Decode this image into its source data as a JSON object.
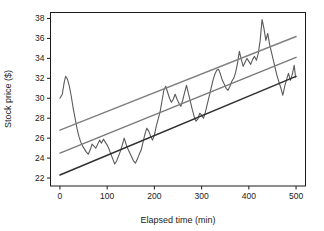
{
  "chart_data": {
    "type": "line",
    "title": "",
    "xlabel": "Elapsed time (min)",
    "ylabel": "Stock price ($)",
    "xlim": [
      -20,
      520
    ],
    "ylim": [
      21.2,
      38.6
    ],
    "xticks": [
      0,
      100,
      200,
      300,
      400,
      500
    ],
    "yticks": [
      22,
      24,
      26,
      28,
      30,
      32,
      34,
      36,
      38
    ],
    "grid": false,
    "legend": "none",
    "colors": {
      "price_series": "#5a5a5a",
      "upper_band": "#808080",
      "middle_trend": "#7a7a7a",
      "lower_band": "#2f2f2f",
      "axis": "#1a1a1a",
      "background": "#ffffff"
    },
    "series": [
      {
        "name": "Stock price",
        "kind": "noisy-line",
        "color": "#5a5a5a",
        "x": [
          0,
          5,
          9,
          12,
          16,
          20,
          24,
          28,
          32,
          36,
          40,
          44,
          48,
          52,
          56,
          60,
          64,
          68,
          72,
          76,
          80,
          84,
          88,
          92,
          96,
          100,
          104,
          108,
          112,
          116,
          120,
          124,
          128,
          132,
          136,
          140,
          144,
          148,
          152,
          156,
          160,
          164,
          168,
          172,
          176,
          180,
          184,
          188,
          192,
          196,
          200,
          204,
          208,
          212,
          216,
          220,
          224,
          228,
          232,
          236,
          240,
          244,
          248,
          252,
          256,
          260,
          264,
          268,
          272,
          276,
          280,
          284,
          288,
          292,
          296,
          300,
          304,
          308,
          312,
          316,
          320,
          324,
          328,
          332,
          336,
          340,
          344,
          348,
          352,
          356,
          360,
          364,
          368,
          372,
          376,
          380,
          384,
          388,
          392,
          396,
          400,
          404,
          408,
          412,
          416,
          420,
          424,
          428,
          432,
          436,
          440,
          444,
          448,
          452,
          456,
          460,
          464,
          468,
          472,
          476,
          480,
          484,
          488,
          492,
          496,
          499
        ],
        "y": [
          30.0,
          30.4,
          31.6,
          32.2,
          31.9,
          31.2,
          30.2,
          29.0,
          28.0,
          27.0,
          26.2,
          25.6,
          25.2,
          24.9,
          24.6,
          24.4,
          24.8,
          25.4,
          25.2,
          25.0,
          25.4,
          25.8,
          25.5,
          25.9,
          25.6,
          25.3,
          24.9,
          24.4,
          23.9,
          23.4,
          23.7,
          24.2,
          24.7,
          25.3,
          26.0,
          25.4,
          24.9,
          24.5,
          24.1,
          23.7,
          23.5,
          23.9,
          24.4,
          24.8,
          25.6,
          26.4,
          27.0,
          26.7,
          26.2,
          25.8,
          26.3,
          27.2,
          27.9,
          28.6,
          29.7,
          30.8,
          31.2,
          30.6,
          30.0,
          29.6,
          29.9,
          30.4,
          29.9,
          29.5,
          29.2,
          29.8,
          30.6,
          31.3,
          30.5,
          29.7,
          28.9,
          28.2,
          27.7,
          27.9,
          28.5,
          28.3,
          28.0,
          28.6,
          29.4,
          30.2,
          31.0,
          31.8,
          32.4,
          32.8,
          32.9,
          32.4,
          31.8,
          31.4,
          31.0,
          30.8,
          31.2,
          31.7,
          32.0,
          32.6,
          33.5,
          34.7,
          33.9,
          33.2,
          33.6,
          34.0,
          33.7,
          33.4,
          33.9,
          34.2,
          33.8,
          34.5,
          35.8,
          37.9,
          37.0,
          35.8,
          36.5,
          35.4,
          34.6,
          33.8,
          33.0,
          32.2,
          31.6,
          31.0,
          30.3,
          31.2,
          31.9,
          32.5,
          31.8,
          32.4,
          33.3,
          32.1
        ]
      },
      {
        "name": "Upper band",
        "kind": "straight-line",
        "color": "#808080",
        "x": [
          0,
          500
        ],
        "y": [
          26.8,
          36.2
        ]
      },
      {
        "name": "Middle trend",
        "kind": "straight-line",
        "color": "#7a7a7a",
        "x": [
          0,
          500
        ],
        "y": [
          24.5,
          34.1
        ]
      },
      {
        "name": "Lower band",
        "kind": "straight-line",
        "color": "#2f2f2f",
        "x": [
          0,
          500
        ],
        "y": [
          22.3,
          32.2
        ]
      }
    ]
  },
  "axes": {
    "x_title": "Elapsed time (min)",
    "y_title": "Stock price ($)",
    "x_tick_labels": [
      "0",
      "100",
      "200",
      "300",
      "400",
      "500"
    ],
    "y_tick_labels": [
      "22",
      "24",
      "26",
      "28",
      "30",
      "32",
      "34",
      "36",
      "38"
    ]
  }
}
